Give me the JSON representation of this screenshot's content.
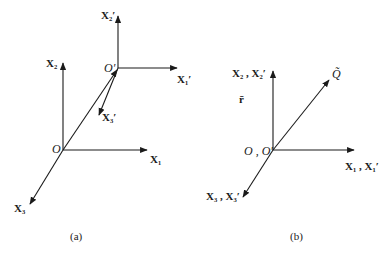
{
  "panel_a": {
    "caption": "(a)",
    "origin_label": "O",
    "origin_prime_label": "O′",
    "axes": {
      "x1": "X₁",
      "x2": "X₂",
      "x3": "X₃",
      "x1_prime": "X₁′",
      "x2_prime": "X₂′",
      "x3_prime": "X₃′"
    }
  },
  "panel_b": {
    "caption": "(b)",
    "origin_label": "O , O′",
    "axes": {
      "x1": "X₁ , X₁′",
      "x2": "X₂ , X₂′",
      "x3": "X₃ , X₃′"
    },
    "vector_label": "r̄",
    "point_label": "Q̃"
  }
}
